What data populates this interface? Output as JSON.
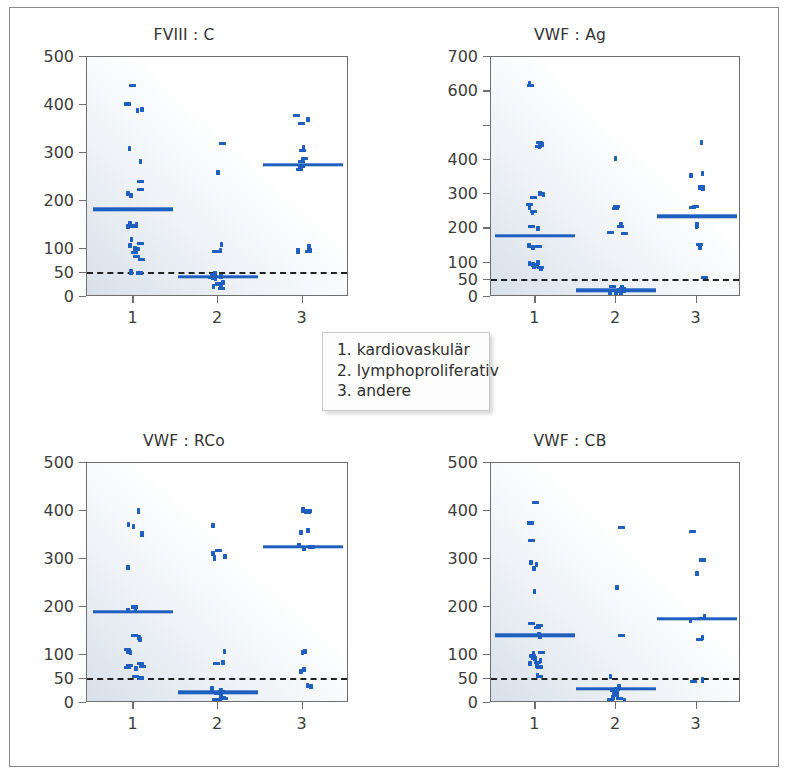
{
  "figure": {
    "background_color": "#ffffff",
    "frame_color": "#8a8a8a",
    "accent_color": "#1f5fbf",
    "reference_line_color": "#222222"
  },
  "legend": {
    "name": "group-legend",
    "lines": [
      "1. kardiovaskulär",
      "2. lymphoproliferativ",
      "3. andere"
    ]
  },
  "chart_data": [
    {
      "type": "scatter",
      "id": "fviii-c",
      "title": "FVIII : C",
      "xlabel": "",
      "ylabel": "",
      "xlim": [
        0.45,
        3.55
      ],
      "ylim": [
        0,
        500
      ],
      "yticks": [
        0,
        50,
        100,
        200,
        300,
        400,
        500
      ],
      "ytick_labels": [
        "0",
        "50",
        "100",
        "200",
        "300",
        "400",
        "500"
      ],
      "xticks": [
        1,
        2,
        3
      ],
      "xtick_labels": [
        "1",
        "2",
        "3"
      ],
      "grid": false,
      "legend_position": "center-figure",
      "reference_line": {
        "y": 50,
        "style": "dashed",
        "label": ""
      },
      "groups": [
        {
          "x": 1,
          "name": "kardiovaskulär",
          "mean": 183,
          "values": [
            440,
            402,
            390,
            388,
            310,
            283,
            240,
            224,
            215,
            212,
            152,
            150,
            148,
            147,
            120,
            112,
            108,
            101,
            100,
            92,
            84,
            78,
            52,
            50
          ]
        },
        {
          "x": 2,
          "name": "lymphoproliferativ",
          "mean": 42,
          "values": [
            320,
            260,
            110,
            97,
            95,
            48,
            46,
            44,
            43,
            41,
            40,
            38,
            30,
            27,
            22,
            20,
            18,
            17
          ]
        },
        {
          "x": 3,
          "name": "andere",
          "mean": 275,
          "values": [
            378,
            370,
            362,
            312,
            305,
            288,
            282,
            272,
            265,
            105,
            100,
            97,
            96,
            95
          ]
        }
      ]
    },
    {
      "type": "scatter",
      "id": "vwf-ag",
      "title": "VWF : Ag",
      "xlabel": "",
      "ylabel": "",
      "xlim": [
        0.45,
        3.55
      ],
      "ylim": [
        0,
        700
      ],
      "yticks": [
        0,
        50,
        100,
        200,
        300,
        400,
        500,
        600,
        700
      ],
      "ytick_labels": [
        "0",
        "50",
        "100",
        "200",
        "300",
        "400",
        "",
        "600",
        "700"
      ],
      "xticks": [
        1,
        2,
        3
      ],
      "xtick_labels": [
        "1",
        "2",
        "3"
      ],
      "grid": false,
      "reference_line": {
        "y": 50,
        "style": "dashed",
        "label": ""
      },
      "groups": [
        {
          "x": 1,
          "name": "kardiovaskulär",
          "mean": 178,
          "values": [
            622,
            618,
            450,
            445,
            440,
            438,
            302,
            298,
            290,
            270,
            262,
            250,
            246,
            205,
            200,
            150,
            148,
            145,
            100,
            97,
            95,
            92,
            88,
            85,
            82
          ]
        },
        {
          "x": 2,
          "name": "lymphoproliferativ",
          "mean": 20,
          "values": [
            403,
            263,
            258,
            210,
            205,
            188,
            185,
            30,
            26,
            24,
            22,
            20,
            18,
            16,
            14,
            12,
            10,
            8
          ]
        },
        {
          "x": 3,
          "name": "andere",
          "mean": 235,
          "values": [
            450,
            360,
            355,
            320,
            318,
            265,
            262,
            210,
            205,
            152,
            148,
            145,
            58
          ]
        }
      ]
    },
    {
      "type": "scatter",
      "id": "vwf-rco",
      "title": "VWF : RCo",
      "xlabel": "",
      "ylabel": "",
      "xlim": [
        0.45,
        3.55
      ],
      "ylim": [
        0,
        500
      ],
      "yticks": [
        0,
        50,
        100,
        200,
        300,
        400,
        500
      ],
      "ytick_labels": [
        "0",
        "50",
        "100",
        "200",
        "300",
        "400",
        "500"
      ],
      "xticks": [
        1,
        2,
        3
      ],
      "xtick_labels": [
        "1",
        "2",
        "3"
      ],
      "grid": false,
      "reference_line": {
        "y": 50,
        "style": "dashed",
        "label": ""
      },
      "groups": [
        {
          "x": 1,
          "name": "kardiovaskulär",
          "mean": 190,
          "values": [
            400,
            372,
            368,
            352,
            282,
            200,
            198,
            192,
            140,
            136,
            132,
            112,
            108,
            106,
            82,
            78,
            76,
            74,
            72,
            55,
            52
          ]
        },
        {
          "x": 2,
          "name": "lymphoproliferativ",
          "mean": 22,
          "values": [
            370,
            318,
            312,
            305,
            302,
            108,
            85,
            82,
            30,
            26,
            24,
            22,
            20,
            16,
            12,
            10,
            8,
            6
          ]
        },
        {
          "x": 3,
          "name": "andere",
          "mean": 325,
          "values": [
            402,
            400,
            398,
            360,
            356,
            328,
            325,
            322,
            108,
            105,
            70,
            66,
            36,
            34
          ]
        }
      ]
    },
    {
      "type": "scatter",
      "id": "vwf-cb",
      "title": "VWF : CB",
      "xlabel": "",
      "ylabel": "",
      "xlim": [
        0.45,
        3.55
      ],
      "ylim": [
        0,
        500
      ],
      "yticks": [
        0,
        50,
        100,
        200,
        300,
        400,
        500
      ],
      "ytick_labels": [
        "0",
        "50",
        "100",
        "200",
        "300",
        "400",
        "500"
      ],
      "xticks": [
        1,
        2,
        3
      ],
      "xtick_labels": [
        "1",
        "2",
        "3"
      ],
      "grid": false,
      "reference_line": {
        "y": 50,
        "style": "dashed",
        "label": ""
      },
      "groups": [
        {
          "x": 1,
          "name": "kardiovaskulär",
          "mean": 141,
          "values": [
            418,
            375,
            338,
            292,
            288,
            280,
            232,
            165,
            162,
            158,
            142,
            138,
            105,
            102,
            98,
            95,
            92,
            88,
            85,
            82,
            78,
            75,
            58,
            55
          ]
        },
        {
          "x": 2,
          "name": "lymphoproliferativ",
          "mean": 30,
          "values": [
            365,
            240,
            140,
            55,
            35,
            32,
            30,
            28,
            26,
            22,
            18,
            15,
            12,
            10,
            8,
            6
          ]
        },
        {
          "x": 3,
          "name": "andere",
          "mean": 175,
          "values": [
            358,
            298,
            270,
            180,
            176,
            172,
            136,
            132,
            48,
            45
          ]
        }
      ]
    }
  ]
}
